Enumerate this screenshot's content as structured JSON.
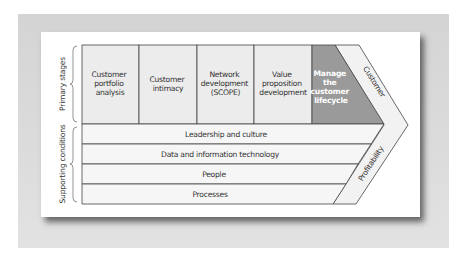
{
  "colors": {
    "background_panel": "#d8d8d8",
    "card": "#ffffff",
    "stage_fill": "#ececec",
    "highlight_fill": "#9a9a9a",
    "row_fill": "#f5f5f5",
    "line": "#444444"
  },
  "side_labels": {
    "primary": "Primary stages",
    "supporting": "Supporting conditions"
  },
  "primary_stages": [
    {
      "lines": [
        "Customer",
        "portfolio",
        "analysis"
      ]
    },
    {
      "lines": [
        "Customer",
        "intimacy"
      ]
    },
    {
      "lines": [
        "Network",
        "development",
        "(SCOPE)"
      ]
    },
    {
      "lines": [
        "Value",
        "proposition",
        "development"
      ]
    },
    {
      "lines": [
        "Manage",
        "the",
        "customer",
        "lifecycle"
      ],
      "highlighted": true
    }
  ],
  "supporting_conditions": [
    "Leadership and culture",
    "Data and information technology",
    "People",
    "Processes"
  ],
  "chevron_labels": {
    "upper": "Customer",
    "lower": "Profitability"
  }
}
